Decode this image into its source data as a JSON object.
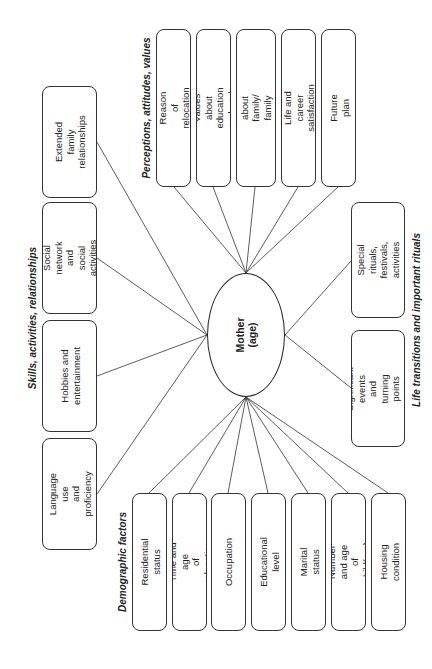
{
  "center": {
    "label": "Mother (age)"
  },
  "groups": {
    "skills": {
      "heading": "Skills, activities, relationships",
      "items": [
        {
          "label": "Extended family\nrelationships"
        },
        {
          "label": "Social network and\nsocial activities"
        },
        {
          "label": "Hobbies and\nentertainment"
        },
        {
          "label": "Language use\nand proficiency"
        }
      ]
    },
    "perceptions": {
      "heading": "Perceptions, attitudes, values",
      "items": [
        {
          "label": "Reason of relocation"
        },
        {
          "label": "Values about education\nand work"
        },
        {
          "label": "Values about family/\nfamily relationships"
        },
        {
          "label": "Life and career satisfaction"
        },
        {
          "label": "Future plan"
        }
      ]
    },
    "life_transitions": {
      "heading": "Life transitions and important rituals",
      "items": [
        {
          "label": "Special rituals,\nfestivals, activities"
        },
        {
          "label": "Significant events\nand turning points\nin life"
        }
      ]
    },
    "demographic": {
      "heading": "Demographic factors",
      "items": [
        {
          "label": "Residential status"
        },
        {
          "label": "Time and age\nof relocation"
        },
        {
          "label": "Occupation"
        },
        {
          "label": "Educational level"
        },
        {
          "label": "Marital status"
        },
        {
          "label": "Number and age\nof child(ren)"
        },
        {
          "label": "Housing condition"
        }
      ]
    }
  }
}
